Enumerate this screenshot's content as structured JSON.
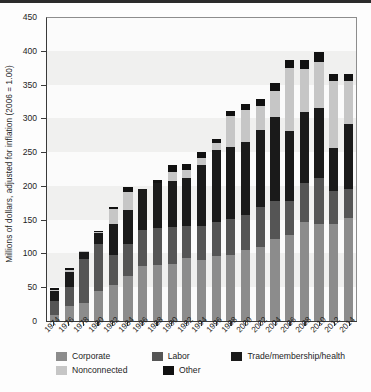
{
  "chart_data": {
    "type": "bar",
    "stacked": true,
    "title": "",
    "xlabel": "",
    "ylabel": "Millions of dollars, adjusted for inflation (2006 = 1.00)",
    "ylim": [
      0,
      450
    ],
    "ytick_step": 50,
    "yticks": [
      0,
      50,
      100,
      150,
      200,
      250,
      300,
      350,
      400,
      450
    ],
    "grid": "horizontal-bands",
    "legend_position": "bottom",
    "categories": [
      1974,
      1976,
      1978,
      1980,
      1982,
      1984,
      1986,
      1988,
      1990,
      1992,
      1994,
      1996,
      1998,
      2000,
      2002,
      2004,
      2006,
      2008,
      2010,
      2012,
      2014
    ],
    "series": [
      {
        "name": "Corporate",
        "color": "#8c8c8c",
        "values": [
          9,
          22,
          26,
          44,
          54,
          66,
          81,
          83,
          85,
          93,
          90,
          96,
          98,
          105,
          109,
          122,
          127,
          146,
          143,
          143,
          153
        ]
      },
      {
        "name": "Labor",
        "color": "#555555",
        "values": [
          20,
          28,
          66,
          70,
          44,
          48,
          54,
          55,
          54,
          48,
          51,
          50,
          53,
          52,
          60,
          55,
          51,
          59,
          68,
          50,
          42
        ]
      },
      {
        "name": "Trade/membership/health",
        "color": "#1a1a1a",
        "values": [
          15,
          22,
          10,
          17,
          46,
          50,
          60,
          67,
          69,
          70,
          90,
          107,
          106,
          108,
          114,
          125,
          103,
          105,
          105,
          63,
          97
        ]
      },
      {
        "name": "Nonconnected",
        "color": "#c6c6c6",
        "values": [
          2,
          4,
          1,
          1,
          22,
          27,
          0,
          0,
          13,
          13,
          10,
          11,
          46,
          47,
          36,
          38,
          94,
          63,
          68,
          99,
          64
        ]
      },
      {
        "name": "Other",
        "color": "#111111",
        "values": [
          3,
          3,
          1,
          1,
          3,
          7,
          1,
          4,
          10,
          8,
          9,
          6,
          8,
          9,
          10,
          12,
          11,
          13,
          14,
          11,
          10
        ]
      }
    ],
    "totals": [
      49,
      79,
      104,
      133,
      169,
      198,
      196,
      209,
      231,
      232,
      250,
      270,
      311,
      321,
      329,
      352,
      386,
      386,
      398,
      366,
      366
    ]
  },
  "legend": {
    "row1": [
      {
        "label": "Corporate",
        "swatch": "#8c8c8c"
      },
      {
        "label": "Labor",
        "swatch": "#555555"
      },
      {
        "label": "Trade/membership/health",
        "swatch": "#1a1a1a"
      }
    ],
    "row2": [
      {
        "label": "Nonconnected",
        "swatch": "#c6c6c6"
      },
      {
        "label": "Other",
        "swatch": "#111111"
      }
    ]
  }
}
